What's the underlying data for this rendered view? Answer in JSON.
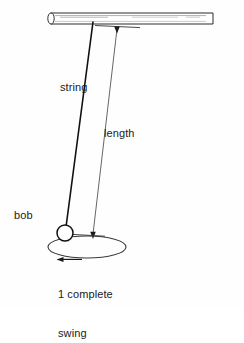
{
  "figure": {
    "background_color": "#fefefe",
    "stroke_color": "#1a1a1a",
    "fill_color": "#ffffff"
  },
  "labels": {
    "string": "string",
    "length": "length",
    "bob": "bob",
    "swing_line1": "1 complete",
    "swing_line2": "swing"
  },
  "parts": {
    "support_rod": "horizontal-support-rod",
    "pendulum_string": "pendulum-string",
    "pendulum_bob": "pendulum-bob",
    "length_dimension": "length-dimension-line",
    "swing_path": "swing-path-ellipse",
    "swing_arrow": "swing-direction-arrow"
  },
  "geometry": {
    "rod": {
      "x1": 48,
      "x2": 213,
      "y_top": 13,
      "y_bottom": 24
    },
    "string": {
      "x1": 93,
      "y1": 22,
      "x2": 66,
      "y2": 228
    },
    "bob": {
      "cx": 65,
      "cy": 233,
      "r": 8
    },
    "length_line": {
      "x1": 117,
      "y1": 30,
      "x2": 93,
      "y2": 235
    },
    "ellipse": {
      "cx": 87,
      "cy": 247,
      "rx": 39,
      "ry": 11
    }
  }
}
